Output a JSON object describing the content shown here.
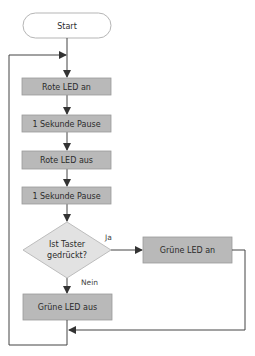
{
  "diagram": {
    "type": "flowchart",
    "colors": {
      "process_fill": "#b9b9b9",
      "process_stroke": "#9a9a9a",
      "decision_fill": "#e2e2e2",
      "decision_stroke": "#bdbdbd",
      "terminal_fill": "#ffffff",
      "terminal_stroke": "#b5b5b5",
      "line": "#444444"
    },
    "nodes": [
      {
        "id": "start",
        "shape": "terminal",
        "label": "Start"
      },
      {
        "id": "red_on",
        "shape": "process",
        "label": "Rote LED an"
      },
      {
        "id": "pause1",
        "shape": "process",
        "label": "1 Sekunde Pause"
      },
      {
        "id": "red_off",
        "shape": "process",
        "label": "Rote LED aus"
      },
      {
        "id": "pause2",
        "shape": "process",
        "label": "1 Sekunde Pause"
      },
      {
        "id": "decision",
        "shape": "decision",
        "label_line1": "Ist Taster",
        "label_line2": "gedrückt?"
      },
      {
        "id": "green_on",
        "shape": "process",
        "label": "Grüne LED an"
      },
      {
        "id": "green_off",
        "shape": "process",
        "label": "Grüne LED aus"
      }
    ],
    "edges": [
      {
        "from": "start",
        "to": "red_on"
      },
      {
        "from": "red_on",
        "to": "pause1"
      },
      {
        "from": "pause1",
        "to": "red_off"
      },
      {
        "from": "red_off",
        "to": "pause2"
      },
      {
        "from": "pause2",
        "to": "decision"
      },
      {
        "from": "decision",
        "to": "green_on",
        "label": "Ja"
      },
      {
        "from": "decision",
        "to": "green_off",
        "label": "Nein"
      },
      {
        "from": "green_on",
        "to": "merge"
      },
      {
        "from": "green_off",
        "to": "red_on",
        "label": "loop"
      }
    ],
    "labels": {
      "yes": "Ja",
      "no": "Nein"
    }
  }
}
